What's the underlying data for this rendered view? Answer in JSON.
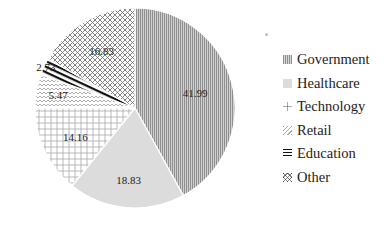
{
  "chart_data": {
    "type": "pie",
    "title": "",
    "start_angle": "12 o'clock",
    "direction": "clockwise",
    "categories": [
      "Government",
      "Healthcare",
      "Technology",
      "Retail",
      "Education",
      "Other"
    ],
    "values": [
      41.99,
      18.83,
      14.16,
      5.47,
      2.73,
      16.83
    ],
    "value_labels": [
      "41.99",
      "18.83",
      "14.16",
      "5.47",
      "2.73",
      "16.83"
    ],
    "patterns": [
      "vertical-lines",
      "solid-light",
      "plus-grid",
      "zigzag",
      "thick-diagonal",
      "crosshatch"
    ],
    "colors": [
      "#a9a9a9",
      "#dcdcdc",
      "#c8c8c8",
      "#cccccc",
      "#1a1a1a",
      "#8a8a8a"
    ],
    "legend": {
      "position": "right",
      "entries": [
        "Government",
        "Healthcare",
        "Technology",
        "Retail",
        "Education",
        "Other"
      ]
    }
  }
}
